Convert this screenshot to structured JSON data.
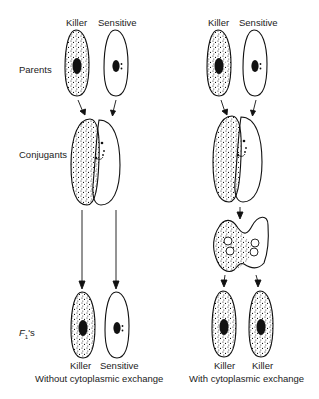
{
  "diagram": {
    "row_labels": {
      "parents": "Parents",
      "conjugants": "Conjugants",
      "f1_prefix": "F",
      "f1_sub": "1",
      "f1_suffix": "'s"
    },
    "left_panel": {
      "top_labels": [
        "Killer",
        "Sensitive"
      ],
      "bottom_labels": [
        "Killer",
        "Sensitive"
      ],
      "caption": "Without cytoplasmic exchange"
    },
    "right_panel": {
      "top_labels": [
        "Killer",
        "Sensitive"
      ],
      "bottom_labels": [
        "Killer",
        "Killer"
      ],
      "caption": "With cytoplasmic exchange"
    },
    "colors": {
      "stroke": "#111111",
      "background": "#ffffff"
    }
  }
}
